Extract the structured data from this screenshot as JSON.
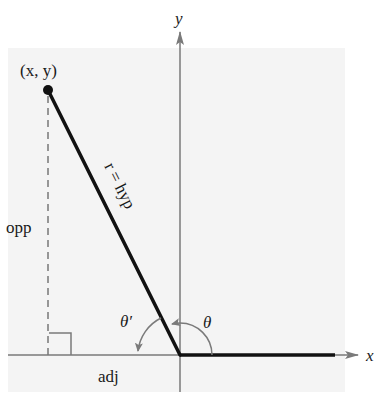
{
  "figure": {
    "type": "reference-angle-diagram",
    "background_shade": "#f4f4f4",
    "colors": {
      "axis": "#7a7a7a",
      "line": "#111111",
      "dashed": "#777777",
      "arc": "#7a7a7a"
    }
  },
  "axes": {
    "x_label": "x",
    "y_label": "y"
  },
  "point": {
    "label": "(x, y)"
  },
  "sides": {
    "hypotenuse": "r = hyp",
    "opposite": "opp",
    "adjacent": "adj"
  },
  "angles": {
    "theta": "θ",
    "theta_prime": "θ′"
  }
}
